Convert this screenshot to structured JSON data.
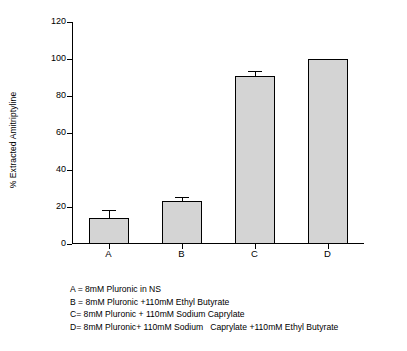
{
  "chart_data": {
    "type": "bar",
    "title": "",
    "xlabel": "",
    "ylabel": "% Extracted Amitriptyline",
    "categories": [
      "A",
      "B",
      "C",
      "D"
    ],
    "values": [
      14,
      23,
      91,
      100
    ],
    "errors": [
      4,
      2,
      2,
      0
    ],
    "ylim": [
      0,
      120
    ],
    "yticks": [
      0,
      20,
      40,
      60,
      80,
      100,
      120
    ],
    "ytick_labels": [
      "0",
      "20",
      "40",
      "60",
      "80",
      "100",
      "120"
    ],
    "grid": false,
    "legend_position": "below-plot",
    "bar_color": "#d4d4d4",
    "bar_edge_color": "#000000",
    "axis_color": "#000000"
  },
  "caption": {
    "lines": [
      "A = 8mM Pluronic in NS",
      "B = 8mM Pluronic +110mM Ethyl Butyrate",
      "C= 8mM Pluronic + 110mM Sodium Caprylate",
      "D= 8mM Pluronic+ 110mM Sodium   Caprylate +110mM Ethyl Butyrate"
    ]
  }
}
